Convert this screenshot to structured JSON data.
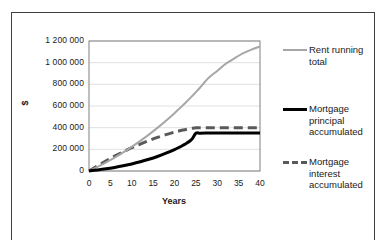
{
  "chart_data": {
    "type": "line",
    "title": "",
    "xlabel": "Years",
    "ylabel": "$",
    "xlim": [
      0,
      40
    ],
    "ylim": [
      0,
      1200000
    ],
    "grid": true,
    "legend_position": "right",
    "x_ticks": [
      "0",
      "5",
      "10",
      "15",
      "20",
      "25",
      "30",
      "35",
      "40"
    ],
    "x_tick_values": [
      0,
      5,
      10,
      15,
      20,
      25,
      30,
      35,
      40
    ],
    "y_ticks": [
      "0",
      "200 000",
      "400 000",
      "600 000",
      "800 000",
      "1 000 000",
      "1 200 000"
    ],
    "y_tick_values": [
      0,
      200000,
      400000,
      600000,
      800000,
      1000000,
      1200000
    ],
    "x": [
      0,
      2,
      4,
      6,
      8,
      10,
      12,
      14,
      16,
      18,
      20,
      21,
      22,
      23,
      24,
      25,
      26,
      28,
      30,
      32,
      34,
      36,
      38,
      40
    ],
    "series": [
      {
        "name": "Rent running total",
        "color": "#a6a6a6",
        "style": "solid",
        "width": 2,
        "values": [
          0,
          38000,
          80000,
          124000,
          172000,
          223000,
          278000,
          336000,
          398000,
          464000,
          534000,
          571000,
          608000,
          647000,
          687000,
          728000,
          771000,
          860000,
          924000,
          990000,
          1040000,
          1085000,
          1120000,
          1150000
        ]
      },
      {
        "name": "Mortgage principal accumulated",
        "color": "#000000",
        "style": "solid",
        "width": 3,
        "values": [
          0,
          9000,
          20000,
          33000,
          48000,
          65000,
          85000,
          108000,
          134000,
          164000,
          198000,
          217000,
          238000,
          261000,
          290000,
          348000,
          349000,
          350000,
          350000,
          350000,
          350000,
          350000,
          350000,
          350000
        ]
      },
      {
        "name": "Mortgage interest accumulated",
        "color": "#595959",
        "style": "dashed",
        "width": 3,
        "values": [
          0,
          48000,
          94000,
          137000,
          177000,
          215000,
          249000,
          281000,
          310000,
          336000,
          359000,
          369000,
          378000,
          386000,
          393000,
          399000,
          400000,
          400000,
          400000,
          400000,
          400000,
          400000,
          400000,
          400000
        ]
      }
    ]
  },
  "legend": [
    {
      "label": "Rent running total"
    },
    {
      "label": "Mortgage principal accumulated"
    },
    {
      "label": "Mortgage interest accumulated"
    }
  ]
}
